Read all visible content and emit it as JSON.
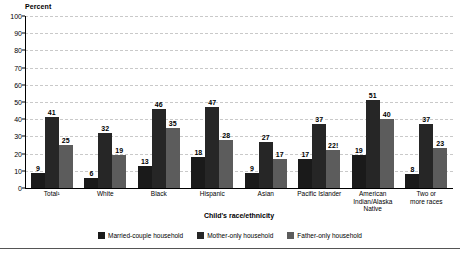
{
  "chart_data": {
    "type": "bar",
    "title": "",
    "xlabel": "Child's race/ethnicity",
    "ylabel": "Percent",
    "ylim": [
      0,
      100
    ],
    "ytick_labels": [
      "0",
      "10",
      "20",
      "30",
      "40",
      "50",
      "60",
      "70",
      "80",
      "90",
      "100"
    ],
    "ytick_values": [
      0,
      10,
      20,
      30,
      40,
      50,
      60,
      70,
      80,
      90,
      100
    ],
    "grid": true,
    "legend_position": "bottom",
    "categories": [
      "Total¹",
      "White",
      "Black",
      "Hispanic",
      "Asian",
      "Pacific Islander",
      "American\nIndian/Alaska\nNative",
      "Two or\nmore races"
    ],
    "series": [
      {
        "name": "Married-couple household",
        "color": "#1a1a1a",
        "values": [
          9,
          6,
          13,
          18,
          9,
          17,
          19,
          8
        ],
        "labels": [
          "9",
          "6",
          "13",
          "18",
          "9",
          "17",
          "19",
          "8"
        ]
      },
      {
        "name": "Mother-only household",
        "color": "#262626",
        "values": [
          41,
          32,
          46,
          47,
          27,
          37,
          51,
          37
        ],
        "labels": [
          "41",
          "32",
          "46",
          "47",
          "27",
          "37",
          "51",
          "37"
        ]
      },
      {
        "name": "Father-only household",
        "color": "#5c5c5c",
        "values": [
          25,
          19,
          35,
          28,
          17,
          22,
          40,
          23
        ],
        "labels": [
          "25",
          "19",
          "35",
          "28",
          "17",
          "22!",
          "40",
          "23"
        ]
      }
    ]
  },
  "legend": {
    "items": [
      {
        "label": "Married-couple household"
      },
      {
        "label": "Mother-only household"
      },
      {
        "label": "Father-only household"
      }
    ]
  }
}
